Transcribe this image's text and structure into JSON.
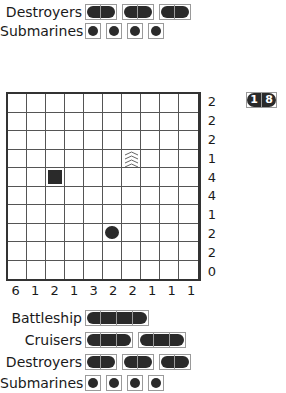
{
  "top_fleet": {
    "destroyers": {
      "label": "Destroyers",
      "ships": [
        2,
        2,
        2
      ]
    },
    "submarines": {
      "label": "Submarines",
      "ships": [
        1,
        1,
        1,
        1
      ]
    }
  },
  "counter": {
    "digits": [
      "1",
      "8"
    ]
  },
  "grid": {
    "size": 10,
    "row_clues": [
      "2",
      "2",
      "2",
      "1",
      "4",
      "4",
      "1",
      "2",
      "2",
      "0"
    ],
    "col_clues": [
      "6",
      "1",
      "2",
      "1",
      "3",
      "2",
      "2",
      "1",
      "1",
      "1"
    ],
    "cells": [
      {
        "row": 3,
        "col": 6,
        "type": "water"
      },
      {
        "row": 4,
        "col": 2,
        "type": "square"
      },
      {
        "row": 7,
        "col": 5,
        "type": "circle"
      }
    ]
  },
  "bottom_fleet": {
    "battleship": {
      "label": "Battleship",
      "ships": [
        4
      ]
    },
    "cruisers": {
      "label": "Cruisers",
      "ships": [
        3,
        3
      ]
    },
    "destroyers": {
      "label": "Destroyers",
      "ships": [
        2,
        2,
        2
      ]
    },
    "submarines": {
      "label": "Submarines",
      "ships": [
        1,
        1,
        1,
        1
      ]
    }
  }
}
